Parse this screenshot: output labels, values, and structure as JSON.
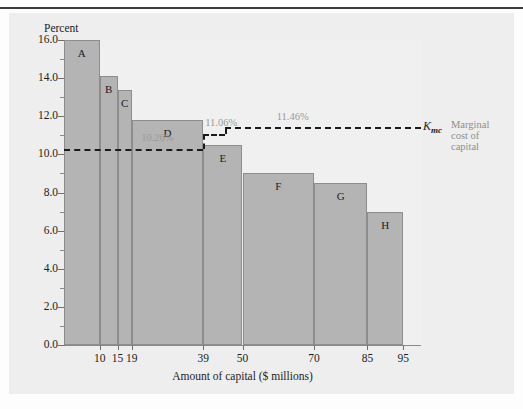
{
  "figure": {
    "y_axis_title": "Percent",
    "x_axis_title": "Amount of capital ($ millions)"
  },
  "chart_data": {
    "type": "bar",
    "title": "",
    "xlabel": "Amount of capital ($ millions)",
    "ylabel": "Percent",
    "ylim": [
      0.0,
      16.0
    ],
    "xlim": [
      0,
      100
    ],
    "grid": false,
    "legend_position": "right",
    "x_tick_labels": [
      "10",
      "15",
      "19",
      "39",
      "50",
      "70",
      "85",
      "95"
    ],
    "x_tick_values": [
      10,
      15,
      19,
      39,
      50,
      70,
      85,
      95
    ],
    "y_tick_labels": [
      "0.0",
      "2.0",
      "4.0",
      "6.0",
      "8.0",
      "10.0",
      "12.0",
      "14.0",
      "16.0"
    ],
    "y_tick_values": [
      0.0,
      2.0,
      4.0,
      6.0,
      8.0,
      10.0,
      12.0,
      14.0,
      16.0
    ],
    "y_minor_ticks": [
      1.0,
      3.0,
      5.0,
      7.0,
      9.0,
      11.0,
      13.0,
      15.0
    ],
    "bars": [
      {
        "label": "A",
        "x_start": 0,
        "x_end": 10,
        "value": 16.0
      },
      {
        "label": "B",
        "x_start": 10,
        "x_end": 15,
        "value": 14.1
      },
      {
        "label": "C",
        "x_start": 15,
        "x_end": 19,
        "value": 13.4
      },
      {
        "label": "D",
        "x_start": 19,
        "x_end": 39,
        "value": 11.8
      },
      {
        "label": "E",
        "x_start": 39,
        "x_end": 50,
        "value": 10.5
      },
      {
        "label": "F",
        "x_start": 50,
        "x_end": 70,
        "value": 9.0
      },
      {
        "label": "G",
        "x_start": 70,
        "x_end": 85,
        "value": 8.5
      },
      {
        "label": "H",
        "x_start": 85,
        "x_end": 95,
        "value": 7.0
      }
    ],
    "annotations": [
      {
        "name": "mcc-level-1",
        "text": "10.26%",
        "value": 10.26,
        "x_start": 0,
        "x_end": 39
      },
      {
        "name": "mcc-level-2",
        "text": "11.06%",
        "value": 11.06,
        "x_start": 39,
        "x_end": 45
      },
      {
        "name": "mcc-level-3",
        "text": "11.46%",
        "value": 11.46,
        "x_start": 45,
        "x_end": 100
      }
    ],
    "series_marker": {
      "symbol": "K",
      "subscript": "mc",
      "description_lines": [
        "Marginal",
        "cost of",
        "capital"
      ]
    },
    "colors": {
      "bar_fill": "#b4b4b4",
      "bar_edge": "#8d8d8d",
      "dashed_line": "#1a1a1a",
      "annotation_text": "#9a9a9a",
      "panel_background": "#eeeeee",
      "plot_background": "#f0f0f0",
      "axis": "#7a7a7a",
      "text": "#1c1c1c"
    }
  }
}
